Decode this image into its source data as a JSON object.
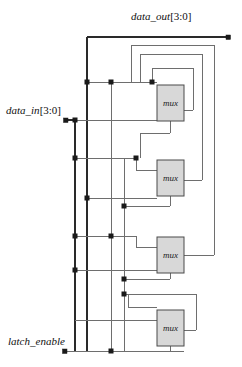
{
  "diagram": {
    "kind": "logic-schematic",
    "title_visible": false,
    "colors": {
      "background": "#ffffff",
      "wire": "#6e6e6e",
      "wire_bold": "#2a2a2a",
      "mux_fill": "#d8d8d8",
      "mux_stroke": "#4a4a4a",
      "junction": "#1a1a1a",
      "text": "#111111"
    }
  },
  "ports": {
    "data_out": {
      "name": "data_out",
      "range": "[3:0]",
      "terminal_x": 228,
      "terminal_y": 37
    },
    "data_in": {
      "name": "data_in",
      "range": "[3:0]",
      "terminal_x": 66,
      "terminal_y": 120
    },
    "latch_enable": {
      "name": "latch_enable",
      "range": "",
      "terminal_x": 65,
      "terminal_y": 351
    }
  },
  "blocks": [
    {
      "id": "mux1",
      "label": "mux",
      "x": 157,
      "y": 85,
      "w": 27,
      "h": 36
    },
    {
      "id": "mux2",
      "label": "mux",
      "x": 157,
      "y": 160,
      "w": 27,
      "h": 36
    },
    {
      "id": "mux3",
      "label": "mux",
      "x": 157,
      "y": 237,
      "w": 27,
      "h": 36
    },
    {
      "id": "mux4",
      "label": "mux",
      "x": 157,
      "y": 310,
      "w": 27,
      "h": 36
    }
  ],
  "buses": [
    {
      "id": "data-out-bus",
      "x": 87,
      "y_top": 37,
      "y_bottom": 351
    },
    {
      "id": "data-in-bus",
      "x": 75,
      "y_top": 120,
      "y_bottom": 351
    },
    {
      "id": "latch-enable-bus-a",
      "x": 111,
      "y_top": 82,
      "y_bottom": 351
    },
    {
      "id": "latch-enable-bus-b",
      "x": 124,
      "y_top": 158,
      "y_bottom": 351
    }
  ],
  "junctions": [
    {
      "x": 87,
      "y": 82
    },
    {
      "x": 87,
      "y": 198
    },
    {
      "x": 75,
      "y": 120
    },
    {
      "x": 75,
      "y": 158
    },
    {
      "x": 75,
      "y": 236
    },
    {
      "x": 75,
      "y": 270
    },
    {
      "x": 111,
      "y": 82
    },
    {
      "x": 111,
      "y": 158
    },
    {
      "x": 111,
      "y": 236
    },
    {
      "x": 111,
      "y": 351
    },
    {
      "x": 124,
      "y": 158
    },
    {
      "x": 124,
      "y": 206
    },
    {
      "x": 124,
      "y": 279
    },
    {
      "x": 124,
      "y": 294
    },
    {
      "x": 136,
      "y": 158
    }
  ],
  "feedback_paths": [
    {
      "id": "fb-mux1",
      "right_x": 193,
      "from_y": 110,
      "to_y": 68,
      "left_x": 152
    },
    {
      "id": "fb-mux2",
      "right_x": 202,
      "from_y": 180,
      "to_y": 54,
      "left_x": 140
    },
    {
      "id": "fb-mux3",
      "right_x": 214,
      "from_y": 255,
      "to_y": 45,
      "left_x": 131
    },
    {
      "id": "fb-mux4",
      "right_x": 196,
      "from_y": 330,
      "to_y": 294,
      "left_x": 128
    }
  ]
}
